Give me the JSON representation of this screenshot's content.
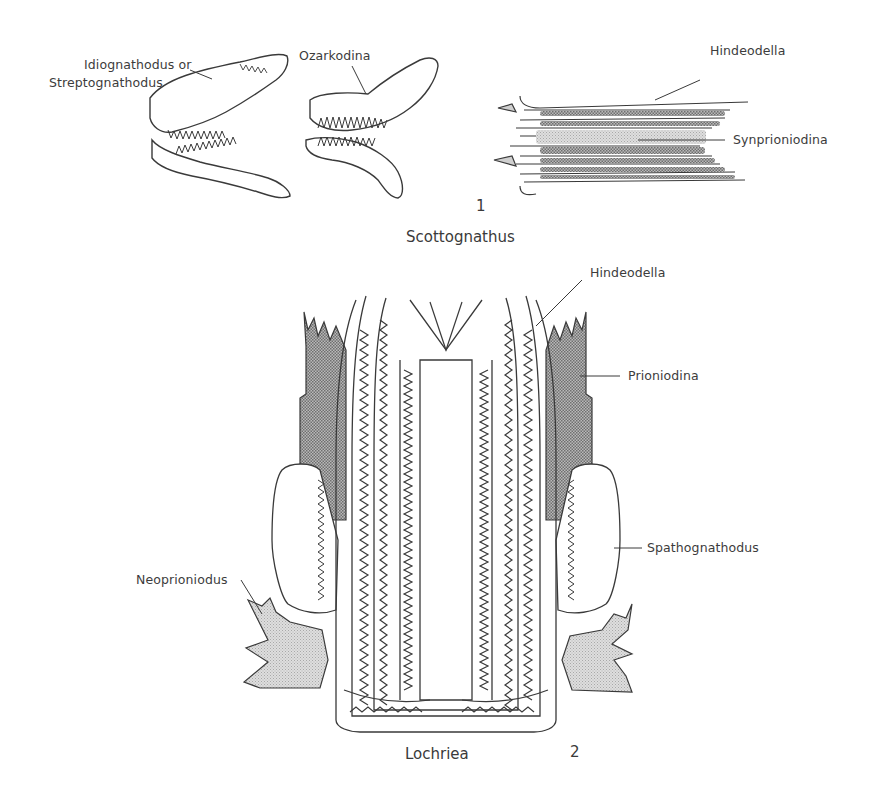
{
  "figure_1": {
    "number": "1",
    "genus_caption": "Scottognathus",
    "labels": {
      "idiognathodus": "Idiognathodus or",
      "streptognathodus": "Streptognathodus",
      "ozarkodina": "Ozarkodina",
      "hindeodella": "Hindeodella",
      "synprioniodina": "Synprioniodina"
    }
  },
  "figure_2": {
    "number": "2",
    "genus_caption": "Lochriea",
    "labels": {
      "hindeodella": "Hindeodella",
      "prioniodina": "Prioniodina",
      "spathognathodus": "Spathognathodus",
      "neoprioniodus": "Neoprioniodus"
    }
  },
  "colors": {
    "line": "#3a3a3a",
    "stipple_dark": "#8a8a8a",
    "stipple_light": "#cfcfcf",
    "background": "#ffffff"
  }
}
